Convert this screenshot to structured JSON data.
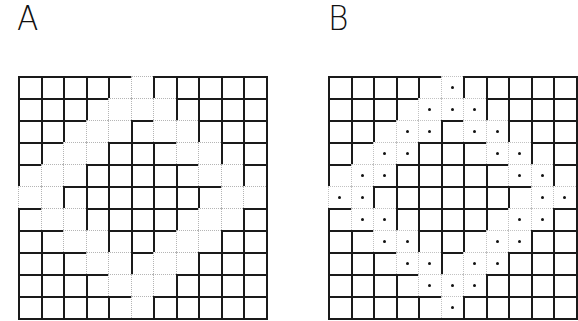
{
  "panels": [
    {
      "label": "A",
      "rows": 11,
      "cols": 11,
      "style": "ring cells outlined with faint dotted borders",
      "ring_cells": [
        [
          0,
          5
        ],
        [
          1,
          4
        ],
        [
          1,
          5
        ],
        [
          1,
          6
        ],
        [
          2,
          3
        ],
        [
          2,
          4
        ],
        [
          2,
          6
        ],
        [
          2,
          7
        ],
        [
          3,
          2
        ],
        [
          3,
          3
        ],
        [
          3,
          7
        ],
        [
          3,
          8
        ],
        [
          4,
          1
        ],
        [
          4,
          2
        ],
        [
          4,
          8
        ],
        [
          4,
          9
        ],
        [
          5,
          0
        ],
        [
          5,
          1
        ],
        [
          5,
          9
        ],
        [
          5,
          10
        ],
        [
          6,
          1
        ],
        [
          6,
          2
        ],
        [
          6,
          8
        ],
        [
          6,
          9
        ],
        [
          7,
          2
        ],
        [
          7,
          3
        ],
        [
          7,
          7
        ],
        [
          7,
          8
        ],
        [
          8,
          3
        ],
        [
          8,
          4
        ],
        [
          8,
          6
        ],
        [
          8,
          7
        ],
        [
          9,
          4
        ],
        [
          9,
          5
        ],
        [
          9,
          6
        ],
        [
          10,
          5
        ]
      ]
    },
    {
      "label": "B",
      "rows": 11,
      "cols": 11,
      "style": "ring cells marked with center dots",
      "dot_cells": [
        [
          0,
          5
        ],
        [
          1,
          4
        ],
        [
          1,
          5
        ],
        [
          1,
          6
        ],
        [
          2,
          3
        ],
        [
          2,
          4
        ],
        [
          2,
          6
        ],
        [
          2,
          7
        ],
        [
          3,
          2
        ],
        [
          3,
          3
        ],
        [
          3,
          7
        ],
        [
          3,
          8
        ],
        [
          4,
          1
        ],
        [
          4,
          2
        ],
        [
          4,
          8
        ],
        [
          4,
          9
        ],
        [
          5,
          0
        ],
        [
          5,
          1
        ],
        [
          5,
          9
        ],
        [
          5,
          10
        ],
        [
          6,
          1
        ],
        [
          6,
          2
        ],
        [
          6,
          8
        ],
        [
          6,
          9
        ],
        [
          7,
          2
        ],
        [
          7,
          3
        ],
        [
          7,
          7
        ],
        [
          7,
          8
        ],
        [
          8,
          3
        ],
        [
          8,
          4
        ],
        [
          8,
          6
        ],
        [
          8,
          7
        ],
        [
          9,
          4
        ],
        [
          9,
          5
        ],
        [
          9,
          6
        ],
        [
          10,
          5
        ]
      ]
    }
  ],
  "colors": {
    "grid_line": "#1a1a1a",
    "ring_line": "#b5b5b5",
    "dot": "#111111",
    "background": "#ffffff"
  }
}
